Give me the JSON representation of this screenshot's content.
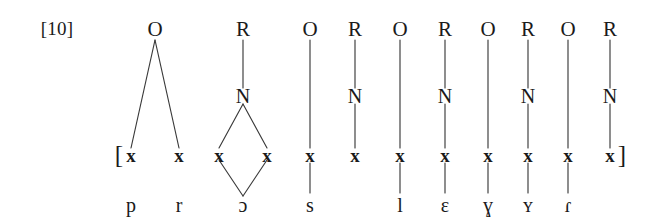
{
  "example": {
    "number_label": "[10]"
  },
  "diagram": {
    "title_present": false,
    "brackets": {
      "open": "[",
      "close": "]"
    },
    "skeleton_symbol": "x",
    "tiers": {
      "constituent": "O/R",
      "nucleus": "N",
      "skeletal": "x",
      "segmental": "segments"
    },
    "constituents": [
      {
        "type": "O",
        "x_slots": [
          1,
          2
        ]
      },
      {
        "type": "R",
        "nucleus": "N",
        "x_slots": [
          3,
          4
        ]
      },
      {
        "type": "O",
        "x_slots": [
          5
        ]
      },
      {
        "type": "R",
        "nucleus": "N",
        "x_slots": [
          6
        ]
      },
      {
        "type": "O",
        "x_slots": [
          7
        ]
      },
      {
        "type": "R",
        "nucleus": "N",
        "x_slots": [
          8
        ]
      },
      {
        "type": "O",
        "x_slots": [
          9
        ]
      },
      {
        "type": "R",
        "nucleus": "N",
        "x_slots": [
          10
        ]
      },
      {
        "type": "O",
        "x_slots": [
          11
        ]
      },
      {
        "type": "R",
        "nucleus": "N",
        "x_slots": [
          12
        ]
      }
    ],
    "skeletal_slots": [
      {
        "index": 1,
        "symbol": "x",
        "segment": "p"
      },
      {
        "index": 2,
        "symbol": "x",
        "segment": "r"
      },
      {
        "index": 3,
        "symbol": "x",
        "segment": "ɔ"
      },
      {
        "index": 4,
        "symbol": "x",
        "segment": "ɔ"
      },
      {
        "index": 5,
        "symbol": "x",
        "segment": "s"
      },
      {
        "index": 6,
        "symbol": "x",
        "segment": ""
      },
      {
        "index": 7,
        "symbol": "x",
        "segment": "l"
      },
      {
        "index": 8,
        "symbol": "x",
        "segment": "ɛ"
      },
      {
        "index": 9,
        "symbol": "x",
        "segment": "ɣ"
      },
      {
        "index": 10,
        "symbol": "x",
        "segment": "ʏ"
      },
      {
        "index": 11,
        "symbol": "x",
        "segment": "ɾ"
      },
      {
        "index": 12,
        "symbol": "x",
        "segment": ""
      }
    ],
    "segment_row": [
      "p",
      "r",
      "ɔ",
      "s",
      "l",
      "ɛ",
      "ɣ",
      "ʏ",
      "ɾ"
    ],
    "top_row": [
      "O",
      "R",
      "O",
      "R",
      "O",
      "R",
      "O",
      "R",
      "O",
      "R"
    ],
    "nucleus_row": [
      "N",
      "N",
      "N",
      "N",
      "N"
    ],
    "colors": {
      "ink": "#1a1a1a",
      "line": "#3a3a3a",
      "background": "#ffffff"
    }
  }
}
